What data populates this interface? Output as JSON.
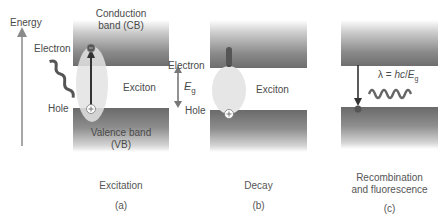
{
  "axis": {
    "label": "Energy"
  },
  "panels": [
    {
      "id": "a",
      "cb_label_line1": "Conduction",
      "cb_label_line2": "band (CB)",
      "vb_label_line1": "Valence band",
      "vb_label_line2": "(VB)",
      "electron_label": "Electron",
      "hole_label": "Hole",
      "exciton_label": "Exciton",
      "gap_label": "E",
      "gap_sub": "g",
      "caption": "Excitation",
      "letter": "(a)"
    },
    {
      "id": "b",
      "electron_label": "Electron",
      "hole_label": "Hole",
      "exciton_label": "Exciton",
      "caption": "Decay",
      "letter": "(b)"
    },
    {
      "id": "c",
      "formula_prefix": "λ = ",
      "formula_italic": "hc",
      "formula_mid": "/",
      "formula_E": "E",
      "formula_sub": "g",
      "caption_line1": "Recombination",
      "caption_line2": "and fluorescence",
      "letter": "(c)"
    }
  ],
  "colors": {
    "band_dark": "#6e6e6e",
    "exciton_fill": "#e6e6e6",
    "arrow": "#333333",
    "text": "#4a4a4a"
  }
}
